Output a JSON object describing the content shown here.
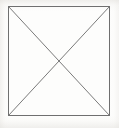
{
  "figure": {
    "type": "crossed-box",
    "caption": "",
    "canvas": {
      "width": 119,
      "height": 128,
      "background_color": "#fdfdfc"
    },
    "stroke": {
      "color": "#6f6f6f",
      "width": 1,
      "style": "solid"
    },
    "box": {
      "x": 8,
      "y": 6,
      "width": 102,
      "height": 110,
      "fill": "none",
      "corners": {
        "top_left": [
          8,
          6
        ],
        "top_right": [
          110,
          6
        ],
        "bottom_right": [
          110,
          116
        ],
        "bottom_left": [
          8,
          116
        ]
      }
    },
    "diagonals": [
      {
        "name": "diagonal-tl-br",
        "from": [
          8,
          6
        ],
        "to": [
          110,
          116
        ]
      },
      {
        "name": "diagonal-tr-bl",
        "from": [
          110,
          6
        ],
        "to": [
          8,
          116
        ]
      }
    ],
    "intersection": {
      "name": "center-crossing",
      "point": [
        59,
        61
      ]
    }
  }
}
